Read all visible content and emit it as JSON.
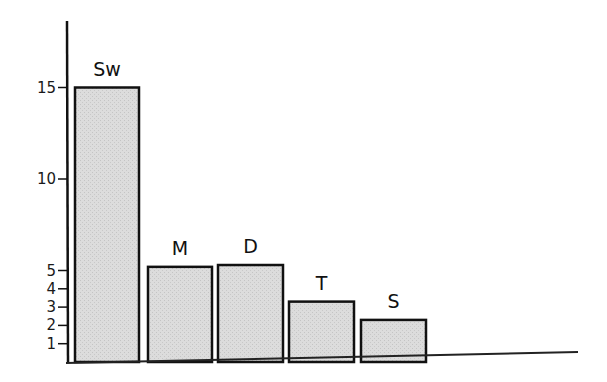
{
  "chart_data": {
    "type": "bar",
    "title": "",
    "xlabel": "",
    "ylabel": "",
    "categories": [
      "Sw",
      "M",
      "D",
      "T",
      "S"
    ],
    "values": [
      15,
      5.2,
      5.3,
      3.3,
      2.3
    ],
    "ylim": [
      0,
      18
    ],
    "yticks": [
      1,
      2,
      3,
      4,
      5,
      10,
      15
    ],
    "grid": false,
    "legend": null,
    "bar_fill": "#d9d9d9",
    "bar_stroke": "#111111",
    "axis_color": "#111111"
  }
}
